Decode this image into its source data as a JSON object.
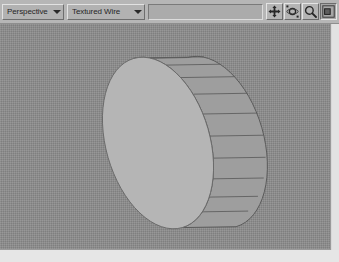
{
  "app": {
    "type": "3d-modeling-viewport",
    "title": "Perspective viewport"
  },
  "toolbar": {
    "view_combo": {
      "name": "viewport-view-dropdown",
      "value": "Perspective",
      "arrow_icon": "chevron-down-icon"
    },
    "shading_combo": {
      "name": "viewport-shading-dropdown",
      "value": "Textured Wire",
      "arrow_icon": "chevron-down-icon"
    },
    "trough": {
      "name": "toolbar-empty-field",
      "value": ""
    },
    "buttons": [
      {
        "name": "pan-view-button",
        "icon": "pan-icon",
        "tooltip": "Pan View",
        "pressed": false
      },
      {
        "name": "orbit-view-button",
        "icon": "orbit-icon",
        "tooltip": "Arc Rotate",
        "pressed": false
      },
      {
        "name": "zoom-view-button",
        "icon": "magnifier-icon",
        "tooltip": "Zoom",
        "pressed": false
      },
      {
        "name": "maximize-viewport-button",
        "icon": "maximize-icon",
        "tooltip": "Min/Max Toggle",
        "pressed": true
      }
    ]
  },
  "viewport": {
    "name": "perspective-viewport",
    "background_color": "#8d8d8d",
    "shading_mode": "Textured Wire",
    "object": {
      "name": "cylinder-object",
      "type": "cylinder",
      "face_color": "#b4b4b4",
      "side_color": "#9a9a9a",
      "wire_color": "#5a5a5a",
      "side_segments": 11,
      "geometry": {
        "cap_center_x": 158,
        "cap_center_y": 119,
        "cap_rx": 52,
        "cap_ry": 88,
        "cap_rotation_deg": -16,
        "depth_x": 52,
        "depth_y": 14
      }
    }
  },
  "colors": {
    "toolbar_bg": "#b6b6b6",
    "control_face": "#b2b2b2",
    "highlight": "#e2e2e2",
    "shadow": "#6e6e6e",
    "page_margin": "#e6e6e6"
  }
}
